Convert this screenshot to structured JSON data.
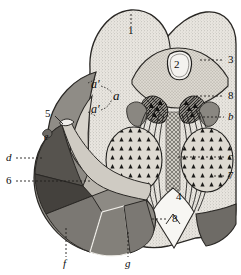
{
  "figure": {
    "background_color": "#ffffff",
    "ink_color": "#151515",
    "labels": [
      {
        "id": "label-1",
        "text": "1",
        "style": "num",
        "x": 128,
        "y": 31,
        "leader": {
          "x1": 131,
          "y1": 14,
          "x2": 131,
          "y2": 27
        }
      },
      {
        "id": "label-2",
        "text": "2",
        "style": "num",
        "x": 174,
        "y": 65,
        "leader": null
      },
      {
        "id": "label-3",
        "text": "3",
        "style": "num",
        "x": 228,
        "y": 56,
        "leader": {
          "x1": 200,
          "y1": 60,
          "x2": 224,
          "y2": 60
        }
      },
      {
        "id": "label-8-upper",
        "text": "8",
        "style": "num",
        "x": 228,
        "y": 92,
        "leader": {
          "x1": 196,
          "y1": 96,
          "x2": 224,
          "y2": 96
        }
      },
      {
        "id": "label-b",
        "text": "b",
        "style": "ital",
        "x": 228,
        "y": 113,
        "leader": {
          "x1": 199,
          "y1": 117,
          "x2": 224,
          "y2": 117
        }
      },
      {
        "id": "label-c",
        "text": "c",
        "style": "ital",
        "x": 228,
        "y": 153,
        "leader": {
          "x1": 178,
          "y1": 157,
          "x2": 224,
          "y2": 157
        }
      },
      {
        "id": "label-7",
        "text": "7",
        "style": "num",
        "x": 228,
        "y": 173,
        "leader": {
          "x1": 214,
          "y1": 176,
          "x2": 224,
          "y2": 176
        }
      },
      {
        "id": "label-4",
        "text": "4",
        "style": "num",
        "x": 176,
        "y": 197,
        "leader": null
      },
      {
        "id": "label-8-lower",
        "text": "8",
        "style": "num",
        "x": 172,
        "y": 216,
        "leader": {
          "x1": 152,
          "y1": 219,
          "x2": 168,
          "y2": 219
        }
      },
      {
        "id": "label-5",
        "text": "5",
        "style": "num",
        "x": 48,
        "y": 114,
        "leader": {
          "x1": 55,
          "y1": 116,
          "x2": 62,
          "y2": 123
        }
      },
      {
        "id": "label-d",
        "text": "d",
        "style": "ital",
        "x": 6,
        "y": 155,
        "leader": {
          "x1": 16,
          "y1": 158,
          "x2": 44,
          "y2": 158
        }
      },
      {
        "id": "label-6",
        "text": "6",
        "style": "num",
        "x": 6,
        "y": 178,
        "leader": {
          "x1": 16,
          "y1": 181,
          "x2": 92,
          "y2": 181
        }
      },
      {
        "id": "label-e",
        "text": "e",
        "style": "itals",
        "x": 44,
        "y": 137,
        "leader": null
      },
      {
        "id": "label-f",
        "text": "f",
        "style": "ital",
        "x": 63,
        "y": 264,
        "leader": {
          "x1": 66,
          "y1": 228,
          "x2": 66,
          "y2": 257
        }
      },
      {
        "id": "label-g",
        "text": "g",
        "style": "ital",
        "x": 125,
        "y": 264,
        "leader": {
          "x1": 128,
          "y1": 232,
          "x2": 128,
          "y2": 257
        }
      },
      {
        "id": "label-a",
        "text": "a",
        "style": "ital",
        "x": 113,
        "y": 95,
        "leader": null
      },
      {
        "id": "label-a-prime",
        "text": "a′",
        "style": "itals",
        "x": 92,
        "y": 85,
        "leader": null
      },
      {
        "id": "label-a-double-prime",
        "text": "a′",
        "style": "itals",
        "x": 92,
        "y": 108,
        "leader": null
      }
    ],
    "regions": [
      {
        "name": "main-body",
        "tone": "#e6e3dd"
      },
      {
        "name": "central-nucleus",
        "tone": "#d4d0c8"
      },
      {
        "name": "inner-oval",
        "tone": "#f2f0ec"
      },
      {
        "name": "raphe-column",
        "tone": "#b4b0a8"
      },
      {
        "name": "dark-wing",
        "tone": "#7d7a74"
      },
      {
        "name": "cerebellum-light",
        "tone": "#d6d2ca"
      },
      {
        "name": "sector-dark",
        "tone": "#5a5752"
      },
      {
        "name": "sector-mid",
        "tone": "#8d8a84"
      },
      {
        "name": "sector-lower",
        "tone": "#7e7b76"
      },
      {
        "name": "wedge-bottom-right",
        "tone": "#6e6b66"
      }
    ]
  }
}
